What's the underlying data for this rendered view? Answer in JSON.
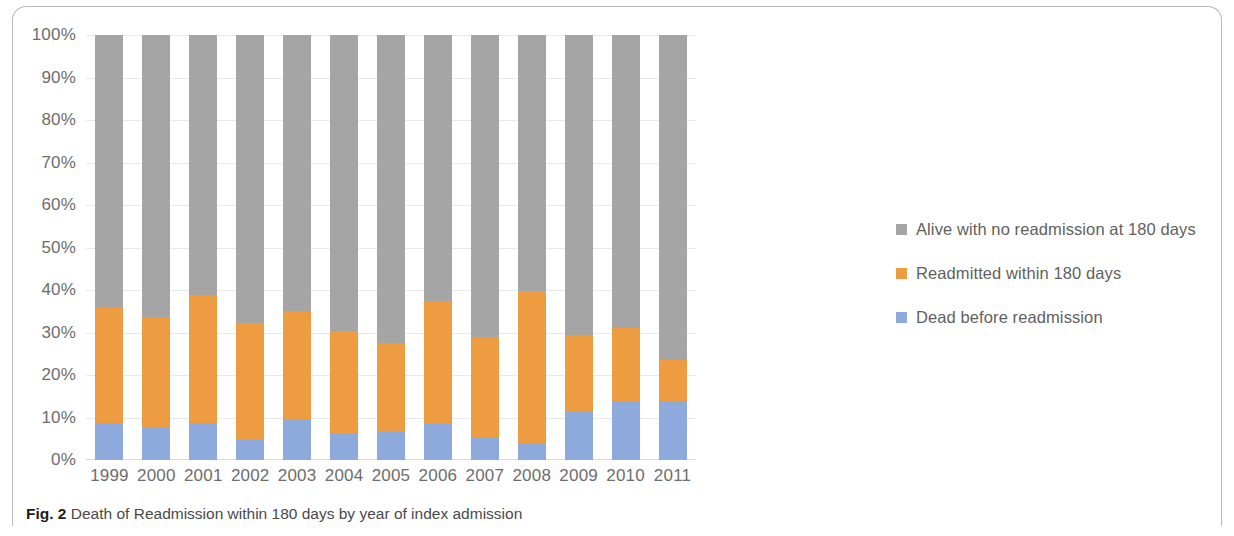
{
  "figure": {
    "caption_number": "Fig. 2",
    "caption_text": "Death of Readmission within 180 days by year of index admission"
  },
  "legend": {
    "position": "right",
    "items": [
      {
        "label": "Alive with no readmission at 180 days",
        "color": "#a5a5a5"
      },
      {
        "label": "Readmitted within 180 days",
        "color": "#ed9c42"
      },
      {
        "label": "Dead before readmission",
        "color": "#8ea9db"
      }
    ]
  },
  "axis": {
    "y_ticks": [
      "100%",
      "90%",
      "80%",
      "70%",
      "60%",
      "50%",
      "40%",
      "30%",
      "20%",
      "10%",
      "0%"
    ],
    "y_tick_values": [
      100,
      90,
      80,
      70,
      60,
      50,
      40,
      30,
      20,
      10,
      0
    ]
  },
  "chart_data": {
    "type": "bar",
    "stacked": true,
    "stack_total": 100,
    "title": "",
    "subtitle": "",
    "xlabel": "",
    "ylabel": "",
    "ylim": [
      0,
      100
    ],
    "grid": true,
    "legend_position": "right",
    "categories": [
      "1999",
      "2000",
      "2001",
      "2002",
      "2003",
      "2004",
      "2005",
      "2006",
      "2007",
      "2008",
      "2009",
      "2010",
      "2011"
    ],
    "series": [
      {
        "name": "Dead before readmission",
        "color": "#8ea9db",
        "values": [
          8.7,
          7.5,
          8.7,
          4.7,
          9.4,
          6.1,
          6.6,
          8.5,
          5.4,
          3.9,
          11.3,
          13.8,
          13.8
        ]
      },
      {
        "name": "Readmitted within 180 days",
        "color": "#ed9c42",
        "values": [
          27.0,
          26.1,
          30.1,
          27.5,
          25.6,
          24.2,
          21.0,
          29.0,
          23.6,
          35.9,
          18.2,
          17.2,
          9.7
        ]
      },
      {
        "name": "Alive with no readmission at 180 days",
        "color": "#a5a5a5",
        "values": [
          64.3,
          66.4,
          61.2,
          67.8,
          65.0,
          69.7,
          72.4,
          62.5,
          71.0,
          60.2,
          70.5,
          69.0,
          76.5
        ]
      }
    ]
  }
}
